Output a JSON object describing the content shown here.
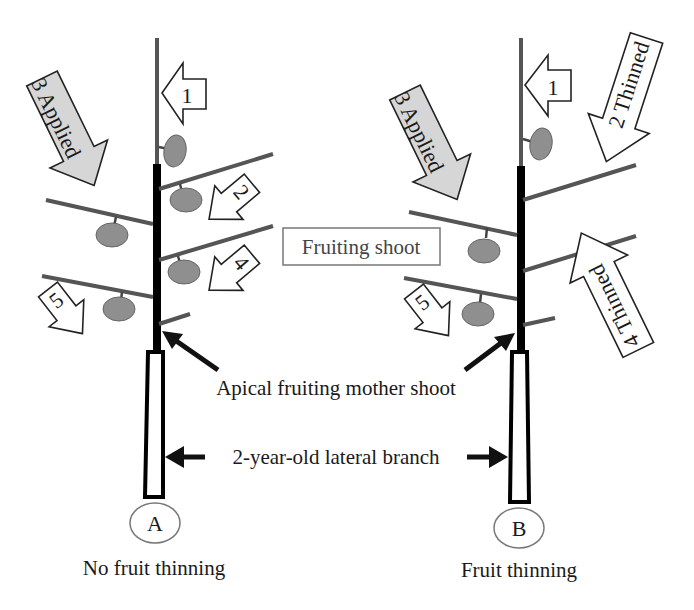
{
  "figure": {
    "panels": [
      {
        "id": "A",
        "letter": "A",
        "caption": "No fruit thinning",
        "arrows": [
          {
            "label": "1",
            "style": "white"
          },
          {
            "label": "2",
            "style": "white"
          },
          {
            "label": "3 Applied",
            "style": "gray"
          },
          {
            "label": "4",
            "style": "white"
          },
          {
            "label": "5",
            "style": "white"
          }
        ],
        "fruit_count": 5
      },
      {
        "id": "B",
        "letter": "B",
        "caption": "Fruit thinning",
        "arrows": [
          {
            "label": "1",
            "style": "white"
          },
          {
            "label": "2 Thinned",
            "style": "white"
          },
          {
            "label": "3 Applied",
            "style": "gray"
          },
          {
            "label": "4 Thinned",
            "style": "white"
          },
          {
            "label": "5",
            "style": "white"
          }
        ],
        "fruit_count": 3
      }
    ],
    "labels": {
      "fruiting_shoot": "Fruiting shoot",
      "apical_fruiting_mother_shoot": "Apical fruiting mother shoot",
      "lateral_branch": "2-year-old lateral branch"
    },
    "colors": {
      "fruit": "#8f8f8f",
      "applied_arrow": "#d6d6d6",
      "branch": "#555555",
      "mother_shoot": "#000000"
    }
  }
}
